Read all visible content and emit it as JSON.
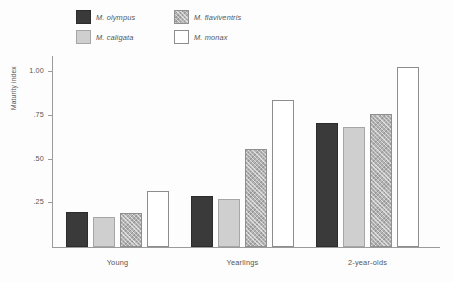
{
  "chart_data": {
    "type": "bar",
    "title": "",
    "xlabel": "",
    "ylabel": "Maturity index",
    "ylim": [
      0,
      1.1
    ],
    "yticks": [
      "1.00",
      ".75",
      ".50",
      ".25"
    ],
    "ytick_values": [
      1.0,
      0.75,
      0.5,
      0.25
    ],
    "grid": false,
    "legend_position": "top",
    "categories": [
      "Young",
      "Yearlings",
      "2-year-olds"
    ],
    "series": [
      {
        "name": "M. olympus",
        "pattern": "solid-dark",
        "color": "#3a3a3a",
        "values": [
          0.2,
          0.29,
          0.71
        ]
      },
      {
        "name": "M. caligata",
        "pattern": "solid-light",
        "color": "#cfcfcf",
        "values": [
          0.17,
          0.275,
          0.69
        ]
      },
      {
        "name": "M. flaviventris",
        "pattern": "cross-hatch",
        "color": "#b3b3b3",
        "values": [
          0.195,
          0.56,
          0.76
        ]
      },
      {
        "name": "M. monax",
        "pattern": "open-white",
        "color": "#ffffff",
        "values": [
          0.32,
          0.845,
          1.03
        ]
      }
    ]
  },
  "legend": {
    "entries": [
      {
        "label": "M. olympus"
      },
      {
        "label": "M. flaviventris"
      },
      {
        "label": "M. caligata"
      },
      {
        "label": "M. monax"
      }
    ]
  },
  "axis": {
    "y_title": "Maturity index",
    "y_ticks": [
      "1.00",
      ".75",
      ".50",
      ".25"
    ],
    "x_categories": [
      "Young",
      "Yearlings",
      "2-year-olds"
    ]
  }
}
